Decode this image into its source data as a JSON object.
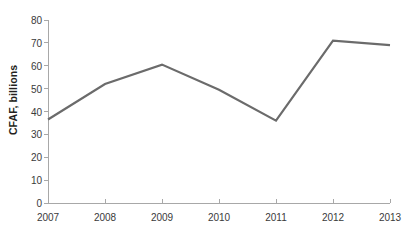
{
  "chart_data": {
    "type": "line",
    "title": "",
    "subtitle": "",
    "xlabel": "",
    "ylabel": "CFAF, billions",
    "categories": [
      "2007",
      "2008",
      "2009",
      "2010",
      "2011",
      "2012",
      "2013"
    ],
    "x": [
      2007,
      2008,
      2009,
      2010,
      2011,
      2012,
      2013
    ],
    "values": [
      36.5,
      52,
      60.5,
      49.5,
      36,
      71,
      69
    ],
    "series": [
      {
        "name": "",
        "values": [
          36.5,
          52,
          60.5,
          49.5,
          36,
          71,
          69
        ]
      }
    ],
    "ylim": [
      0,
      80
    ],
    "ytick_labels": [
      "0",
      "10",
      "20",
      "30",
      "40",
      "50",
      "60",
      "70",
      "80"
    ],
    "ytick_values": [
      0,
      10,
      20,
      30,
      40,
      50,
      60,
      70,
      80
    ],
    "xtick_labels": [
      "2007",
      "2008",
      "2009",
      "2010",
      "2011",
      "2012",
      "2013"
    ],
    "grid": false,
    "legend": false,
    "legend_position": "none",
    "line_color": "#6b6b6b",
    "axis_color": "#a8a8a8",
    "text_color": "#231f20",
    "background_color": "#ffffff"
  }
}
